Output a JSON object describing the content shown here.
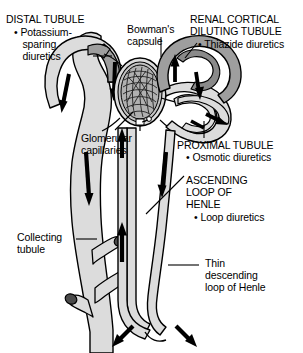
{
  "figure": {
    "title_semantic": "nephron-diuretic-sites-diagram",
    "background_color": "#ffffff",
    "tubule_fill": "#dcdcdc",
    "highlight_fill": "#9e9e9e",
    "highlight_fill_dark": "#8a8a8a",
    "outline_color": "#000000",
    "arrow_color": "#000000",
    "glomerulus_fill": "#b8b8b8"
  },
  "labels": {
    "distal_tubule": {
      "heading": "DISTAL TUBULE",
      "bullet": "• Potassium-",
      "bullet_line2": "   sparing",
      "bullet_line3": "   diuretics"
    },
    "bowmans_capsule": {
      "line1": "Bowman's",
      "line2": "capsule"
    },
    "renal_cortical_diluting_tubule": {
      "line1": "RENAL CORTICAL",
      "line2": "DILUTING TUBULE",
      "bullet": "• Thiazide diuretics"
    },
    "glomerular_capillaries": {
      "line1": "Glomerular",
      "line2": "capillaries"
    },
    "proximal_tubule": {
      "heading": "PROXIMAL TUBULE",
      "bullet": "• Osmotic diuretics"
    },
    "ascending_loop_of_henle": {
      "line1": "ASCENDING",
      "line2": "LOOP OF",
      "line3": "HENLE",
      "bullet": "• Loop diuretics"
    },
    "collecting_tubule": {
      "line1": "Collecting",
      "line2": "tubule"
    },
    "thin_descending_loop": {
      "line1": "Thin",
      "line2": "descending",
      "line3": "loop of Henle"
    }
  }
}
